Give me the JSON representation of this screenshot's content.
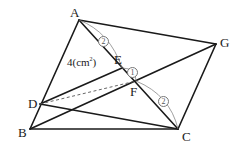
{
  "diagram": {
    "points": {
      "A": {
        "label": "A",
        "x": 79,
        "y": 20
      },
      "G": {
        "label": "G",
        "x": 216,
        "y": 44
      },
      "E": {
        "label": "E",
        "x": 122,
        "y": 68
      },
      "F": {
        "label": "F",
        "x": 136,
        "y": 81
      },
      "D": {
        "label": "D",
        "x": 40,
        "y": 104
      },
      "B": {
        "label": "B",
        "x": 30,
        "y": 129
      },
      "C": {
        "label": "C",
        "x": 178,
        "y": 129
      }
    },
    "area_label": {
      "value": "4",
      "unit_open": "(cm",
      "unit_sup": "2",
      "unit_close": ")"
    },
    "ratios": {
      "AE": "2",
      "EF": "1",
      "FC": "2"
    },
    "colors": {
      "line": "#1a1a1a",
      "dashed": "#555555",
      "arc": "#777777"
    }
  }
}
